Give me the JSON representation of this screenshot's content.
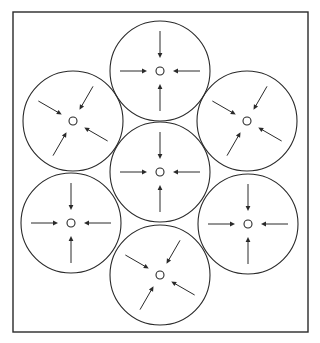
{
  "canvas": {
    "width": 320,
    "height": 343,
    "background": "#ffffff",
    "stroke": "#2a2a2a"
  },
  "frame": {
    "x": 13,
    "y": 12,
    "width": 295,
    "height": 320
  },
  "style": {
    "circle_radius": 50,
    "core_radius": 4,
    "arrow_outer": 40,
    "arrow_inner": 13,
    "arrowhead_length": 5,
    "arrowhead_width": 2.4
  },
  "cells": [
    {
      "id": "top",
      "cx": 160,
      "cy": 71,
      "rotation": 0
    },
    {
      "id": "upper-left",
      "cx": 73,
      "cy": 121,
      "rotation": 30
    },
    {
      "id": "upper-right",
      "cx": 247,
      "cy": 121,
      "rotation": 30
    },
    {
      "id": "center",
      "cx": 160,
      "cy": 172,
      "rotation": 0
    },
    {
      "id": "lower-left",
      "cx": 71,
      "cy": 223,
      "rotation": 0
    },
    {
      "id": "lower-right",
      "cx": 248,
      "cy": 224,
      "rotation": 0
    },
    {
      "id": "bottom",
      "cx": 160,
      "cy": 275,
      "rotation": 30
    }
  ],
  "arrows_per_cell": 4,
  "arrow_direction": "inward-to-center"
}
